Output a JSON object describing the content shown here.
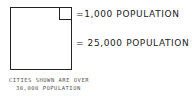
{
  "legend": {
    "small_square_label": "=1,000 POPULATION",
    "large_square_label": "= 25,000 POPULATION",
    "note_line1": "CITIES SHOWN ARE OVER",
    "note_line2": "30,000 POPULATION"
  },
  "colors": {
    "stroke": "#222222",
    "background": "#ffffff",
    "note_text": "#555555"
  }
}
